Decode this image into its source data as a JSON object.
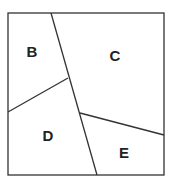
{
  "diagram": {
    "type": "partitioned-square",
    "stroke_color": "#333333",
    "regions": [
      {
        "label": "B",
        "x": 32,
        "y": 57
      },
      {
        "label": "C",
        "x": 115,
        "y": 61
      },
      {
        "label": "D",
        "x": 48,
        "y": 141
      },
      {
        "label": "E",
        "x": 124,
        "y": 158
      }
    ],
    "lines": [
      {
        "from": [
          51,
          13
        ],
        "to": [
          97,
          175
        ]
      },
      {
        "from": [
          8,
          112
        ],
        "to": [
          68,
          78
        ]
      },
      {
        "from": [
          80,
          113
        ],
        "to": [
          164,
          135
        ]
      }
    ]
  }
}
